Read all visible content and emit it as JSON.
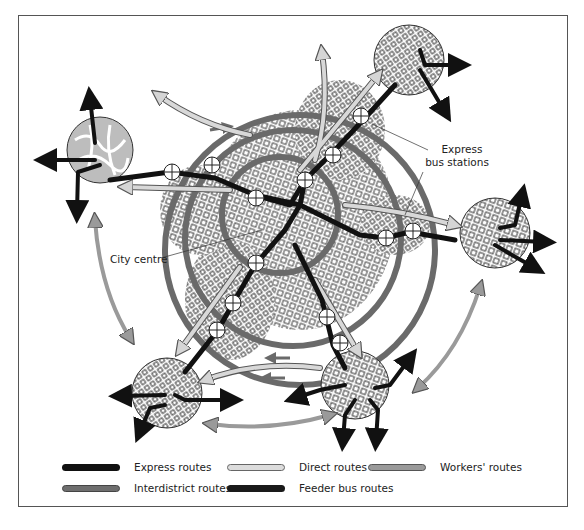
{
  "diagram": {
    "title": "",
    "labels": {
      "city_centre": "City centre",
      "express_stations_line1": "Express",
      "express_stations_line2": "bus stations"
    },
    "colors": {
      "express": "#111111",
      "interdistrict": "#6e6e6e",
      "direct": "#cfcfcf",
      "workers": "#9a9a9a",
      "feeder": "#1a1a1a",
      "district_fill": "#bdbdbd",
      "ring": "#6a6a6a"
    }
  },
  "legend": {
    "items": [
      {
        "label": "Express routes",
        "key": "express"
      },
      {
        "label": "Direct routes",
        "key": "direct"
      },
      {
        "label": "Workers' routes",
        "key": "workers"
      },
      {
        "label": "Interdistrict routes",
        "key": "interdistrict"
      },
      {
        "label": "Feeder bus routes",
        "key": "feeder"
      }
    ]
  }
}
